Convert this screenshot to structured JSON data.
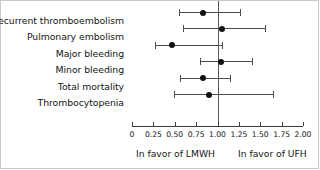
{
  "chart_data": {
    "type": "scatter",
    "subtype": "forest-plot",
    "title": "",
    "xlabel": "",
    "ylabel": "",
    "xlim": [
      0,
      2.0
    ],
    "grid": false,
    "reference_line": 1.0,
    "legend_position": "none",
    "categories": [
      "Recurrent thromboembolism",
      "Pulmonary embolism",
      "Major bleeding",
      "Minor bleeding",
      "Total mortality",
      "Thrombocytopenia"
    ],
    "tick_labels": [
      "0",
      "0.25",
      "0.50",
      "0.75",
      "1.00",
      "1.25",
      "1.50",
      "1.75",
      "2.00"
    ],
    "tick_values": [
      0,
      0.25,
      0.5,
      0.75,
      1.0,
      1.25,
      1.5,
      1.75,
      2.0
    ],
    "annotations": {
      "left_favor": "In favor of LMWH",
      "right_favor": "In favor of UFH"
    },
    "rows": [
      {
        "label": "Recurrent thromboembolism",
        "estimate": 0.83,
        "ci_low": 0.55,
        "ci_high": 1.26
      },
      {
        "label": "Pulmonary embolism",
        "estimate": 1.05,
        "ci_low": 0.6,
        "ci_high": 1.55
      },
      {
        "label": "Major bleeding",
        "estimate": 0.47,
        "ci_low": 0.27,
        "ci_high": 1.05
      },
      {
        "label": "Minor bleeding",
        "estimate": 1.04,
        "ci_low": 0.8,
        "ci_high": 1.4
      },
      {
        "label": "Total mortality",
        "estimate": 0.83,
        "ci_low": 0.56,
        "ci_high": 1.15
      },
      {
        "label": "Thrombocytopenia",
        "estimate": 0.9,
        "ci_low": 0.49,
        "ci_high": 1.65
      }
    ],
    "colors": {
      "point": "#111111",
      "interval": "#4d4d4d",
      "axis": "#3c3c3c",
      "reference": "#5a5a5a",
      "text": "#151515",
      "background": "#ffffff"
    }
  }
}
